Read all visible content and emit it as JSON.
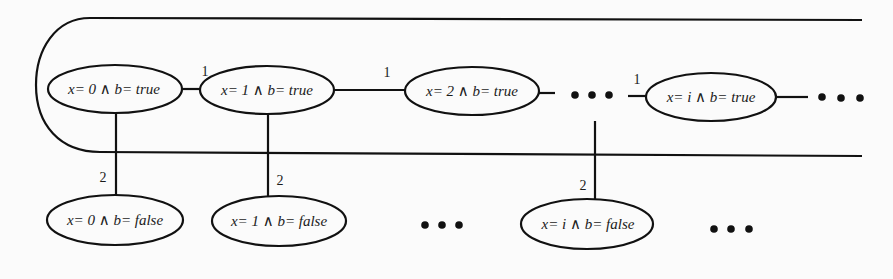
{
  "diagram": {
    "type": "state-transition-graph",
    "colors": {
      "stroke": "#111111",
      "background": "#fbfbfb",
      "text": "#1a1a1a"
    },
    "top_row": [
      {
        "id": "t0",
        "label": "x= 0 ∧ b= true"
      },
      {
        "id": "t1",
        "label": "x= 1 ∧ b= true"
      },
      {
        "id": "t2",
        "label": "x= 2 ∧ b= true"
      },
      {
        "id": "ti",
        "label": "x= i ∧ b= true"
      }
    ],
    "bottom_row": [
      {
        "id": "f0",
        "label": "x= 0 ∧ b= false"
      },
      {
        "id": "f1",
        "label": "x= 1 ∧ b= false"
      },
      {
        "id": "fi",
        "label": "x= i ∧ b= false"
      }
    ],
    "edge_labels": {
      "t0_t1": "1",
      "t1_t2": "1",
      "dots_ti": "1",
      "t0_f0": "2",
      "t1_f1": "2",
      "ti_fi": "2"
    },
    "ellipsis": "• • •"
  }
}
